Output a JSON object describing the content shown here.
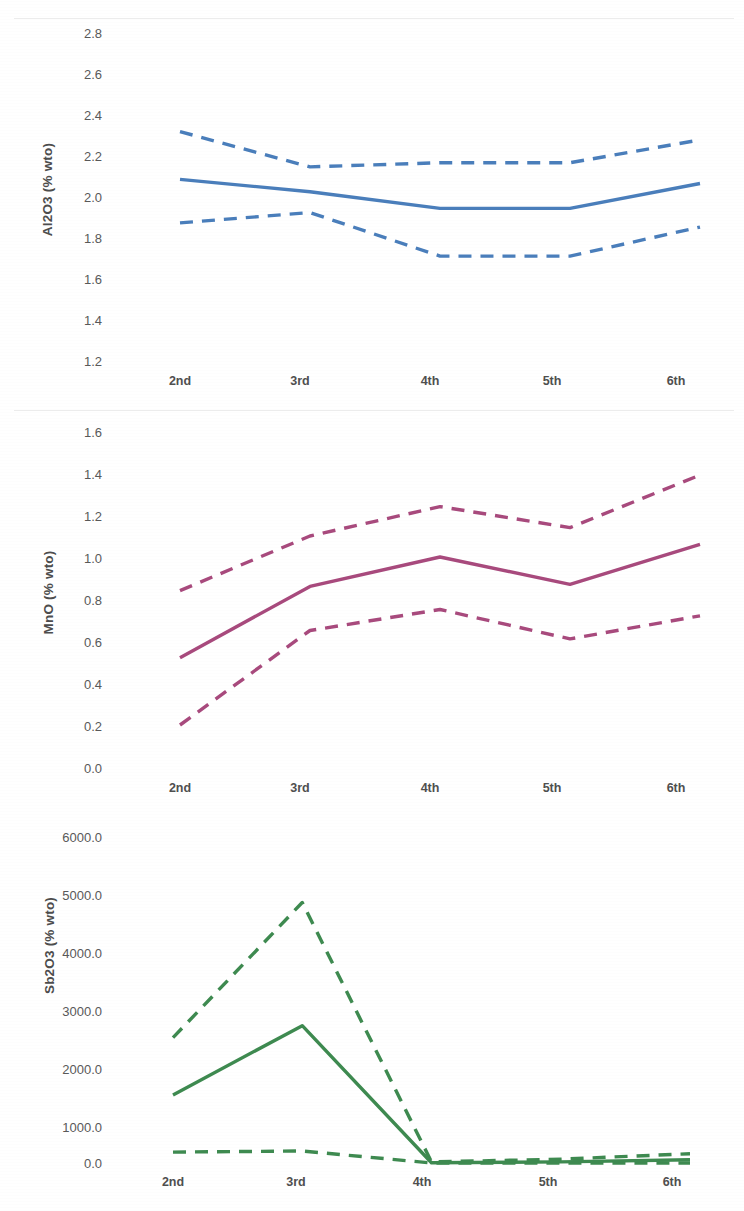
{
  "figure": {
    "background_color": "#ffffff",
    "panel_count": 3,
    "shared_categories": [
      "2nd",
      "3rd",
      "4th",
      "5th",
      "6th"
    ]
  },
  "chart_data": [
    {
      "type": "line",
      "title": "",
      "xlabel": "",
      "ylabel": "Al2O3 (% wto)",
      "categories": [
        "2nd",
        "3rd",
        "4th",
        "5th",
        "6th"
      ],
      "ylim": [
        1.2,
        2.8
      ],
      "yticks": [
        "1.2",
        "1.4",
        "1.6",
        "1.8",
        "2.0",
        "2.2",
        "2.4",
        "2.6",
        "2.8"
      ],
      "ytick_values": [
        1.2,
        1.4,
        1.6,
        1.8,
        2.0,
        2.2,
        2.4,
        2.6,
        2.8
      ],
      "grid": false,
      "legend": "none",
      "color": "#4a7ebb",
      "series": [
        {
          "name": "upper bound",
          "style": "dashed",
          "values": [
            2.32,
            2.15,
            2.17,
            2.17,
            2.28
          ]
        },
        {
          "name": "mean",
          "style": "solid",
          "values": [
            2.09,
            2.03,
            1.95,
            1.95,
            2.07
          ]
        },
        {
          "name": "lower bound",
          "style": "dashed",
          "values": [
            1.88,
            1.93,
            1.72,
            1.72,
            1.86
          ]
        }
      ]
    },
    {
      "type": "line",
      "title": "",
      "xlabel": "",
      "ylabel": "MnO (% wto)",
      "categories": [
        "2nd",
        "3rd",
        "4th",
        "5th",
        "6th"
      ],
      "ylim": [
        0.0,
        1.6
      ],
      "yticks": [
        "0.0",
        "0.2",
        "0.4",
        "0.6",
        "0.8",
        "1.0",
        "1.2",
        "1.4",
        "1.6"
      ],
      "ytick_values": [
        0.0,
        0.2,
        0.4,
        0.6,
        0.8,
        1.0,
        1.2,
        1.4,
        1.6
      ],
      "grid": false,
      "legend": "none",
      "color": "#a84a7d",
      "series": [
        {
          "name": "upper bound",
          "style": "dashed",
          "values": [
            0.84,
            1.1,
            1.24,
            1.14,
            1.39
          ]
        },
        {
          "name": "mean",
          "style": "solid",
          "values": [
            0.52,
            0.86,
            1.0,
            0.87,
            1.06
          ]
        },
        {
          "name": "lower bound",
          "style": "dashed",
          "values": [
            0.2,
            0.65,
            0.75,
            0.61,
            0.72
          ]
        }
      ]
    },
    {
      "type": "line",
      "title": "",
      "xlabel": "",
      "ylabel": "Sb2O3 (% wto)",
      "categories": [
        "2nd",
        "3rd",
        "4th",
        "5th",
        "6th"
      ],
      "ylim": [
        0.0,
        6000.0
      ],
      "yticks": [
        "0.0",
        "1000.0",
        "2000.0",
        "3000.0",
        "4000.0",
        "5000.0",
        "6000.0"
      ],
      "ytick_values": [
        0.0,
        1000.0,
        2000.0,
        3000.0,
        4000.0,
        5000.0,
        6000.0
      ],
      "grid": false,
      "legend": "none",
      "color": "#3e8a50",
      "series": [
        {
          "name": "upper bound",
          "style": "dashed",
          "values": [
            2300,
            4780,
            20,
            70,
            170
          ]
        },
        {
          "name": "mean",
          "style": "solid",
          "values": [
            1250,
            2520,
            5,
            20,
            60
          ]
        },
        {
          "name": "lower bound",
          "style": "dashed",
          "values": [
            200,
            220,
            0,
            0,
            0
          ]
        }
      ]
    }
  ]
}
